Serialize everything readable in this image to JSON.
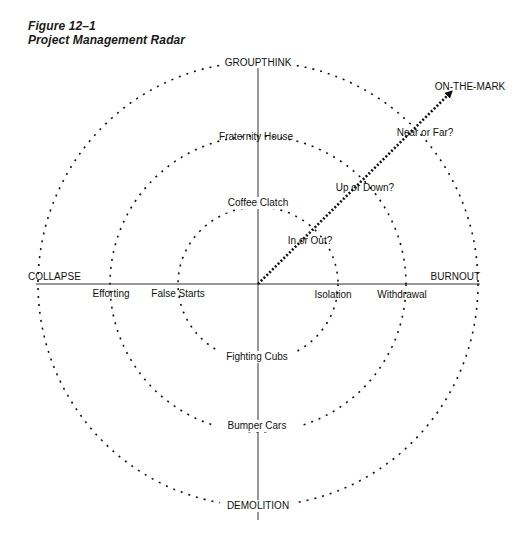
{
  "figure": {
    "number": "Figure 12–1",
    "title": "Project Management Radar"
  },
  "center": {
    "x": 258,
    "y": 284
  },
  "rings": [
    {
      "name": "inner",
      "rx": 80,
      "ry": 77
    },
    {
      "name": "middle",
      "rx": 148,
      "ry": 148
    },
    {
      "name": "outer",
      "rx": 220,
      "ry": 222
    }
  ],
  "axes": {
    "top": "GROUPTHINK",
    "bottom": "DEMOLITION",
    "left": "COLLAPSE",
    "right": "BURNOUT"
  },
  "ring_labels": {
    "top": [
      "Coffee Clatch",
      "Fraternity House"
    ],
    "bottom": [
      "Fighting Cubs",
      "Bumper Cars"
    ],
    "left": [
      "False Starts",
      "Efforting"
    ],
    "right": [
      "Isolation",
      "Withdrawal"
    ]
  },
  "diagonal": {
    "target": "ON-THE-MARK",
    "questions": [
      "In or Out?",
      "Up or Down?",
      "Near or Far?"
    ]
  },
  "colors": {
    "ink": "#111111",
    "background": "#ffffff"
  }
}
